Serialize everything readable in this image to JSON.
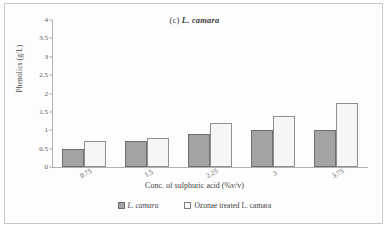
{
  "figure": {
    "panel_label": "(c)",
    "species": "L. camara",
    "border_color": "#c9c9c9"
  },
  "chart_data": {
    "type": "bar",
    "title": "(c) L. camara",
    "xlabel": "Conc. of sulphuric acid (%v/v)",
    "ylabel": "Phenolics (g/L)",
    "categories": [
      "0.75",
      "1.5",
      "2.25",
      "3",
      "3.75"
    ],
    "series": [
      {
        "name": "L. camara",
        "values": [
          0.5,
          0.7,
          0.9,
          1.0,
          1.0
        ],
        "color": "#a3a3a3"
      },
      {
        "name": "Ozonae treated L. camara",
        "values": [
          0.7,
          0.78,
          1.2,
          1.4,
          1.75
        ],
        "color": "#f6f6f4"
      }
    ],
    "ylim": [
      0,
      4
    ],
    "yticks": [
      "0",
      "0.5",
      "1",
      "1.5",
      "2",
      "2.5",
      "3",
      "3.5",
      "4"
    ],
    "grid": false,
    "legend_position": "bottom"
  }
}
